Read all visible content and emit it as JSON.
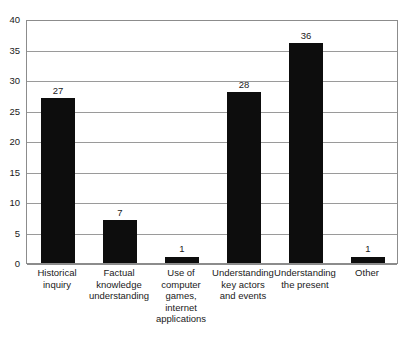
{
  "chart_data": {
    "type": "bar",
    "title": "",
    "subtitle": "",
    "xlabel": "",
    "ylabel": "",
    "ylim": [
      0,
      40
    ],
    "ytick_step": 5,
    "yticks": [
      0,
      5,
      10,
      15,
      20,
      25,
      30,
      35,
      40
    ],
    "ytick_labels": [
      "0",
      "5",
      "10",
      "15",
      "20",
      "25",
      "30",
      "35",
      "40"
    ],
    "grid": true,
    "grid_axis": "y",
    "legend": false,
    "legend_position": "none",
    "orientation": "vertical",
    "categories": [
      "Historical inquiry",
      "Factual knowledge understanding",
      "Use of computer games, internet applications",
      "Understanding key actors and events",
      "Understanding the present",
      "Other"
    ],
    "category_label_lines": [
      [
        "Historical",
        "inquiry"
      ],
      [
        "Factual",
        "knowledge",
        "understanding"
      ],
      [
        "Use of",
        "computer",
        "games,",
        "internet",
        "applications"
      ],
      [
        "Understanding",
        "key actors",
        "and events"
      ],
      [
        "Understanding",
        "the present"
      ],
      [
        "Other"
      ]
    ],
    "values": [
      27,
      7,
      1,
      28,
      36,
      1
    ],
    "data_labels": [
      "27",
      "7",
      "1",
      "28",
      "36",
      "1"
    ],
    "bar_color": "#0d0d0d",
    "grid_color": "#9a9a9a",
    "axis_color": "#8c8c8c",
    "background_color": "#ffffff",
    "text_color": "#1a1a1a"
  }
}
